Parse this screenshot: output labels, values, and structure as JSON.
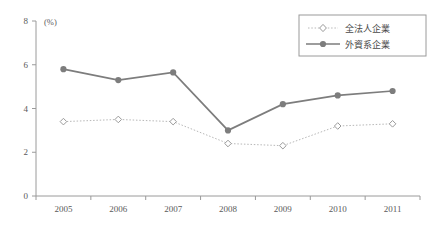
{
  "chart_data": {
    "type": "line",
    "title": "",
    "xlabel": "",
    "ylabel": "",
    "unit_label": "(%)",
    "categories": [
      "2005",
      "2006",
      "2007",
      "2008",
      "2009",
      "2010",
      "2011"
    ],
    "ylim": [
      0,
      8
    ],
    "yticks": [
      0,
      2,
      4,
      6,
      8
    ],
    "ytick_labels": [
      "0",
      "2",
      "4",
      "6",
      "8"
    ],
    "grid": false,
    "legend_position": "top-right",
    "series": [
      {
        "name": "全法人企業",
        "values": [
          3.4,
          3.5,
          3.4,
          2.4,
          2.3,
          3.2,
          3.3
        ],
        "color": "#b8b8b8",
        "marker": "open-diamond",
        "line_style": "dotted"
      },
      {
        "name": "外資系企業",
        "values": [
          5.8,
          5.3,
          5.65,
          3.0,
          4.2,
          4.6,
          4.8
        ],
        "color": "#7d7d7d",
        "marker": "filled-circle",
        "line_style": "solid"
      }
    ]
  },
  "legend": {
    "items": [
      {
        "label": "全法人企業"
      },
      {
        "label": "外資系企業"
      }
    ]
  },
  "axis": {
    "y_unit": "(%)",
    "y_labels": [
      "8",
      "6",
      "4",
      "2",
      "0"
    ],
    "x_labels": [
      "2005",
      "2006",
      "2007",
      "2008",
      "2009",
      "2010",
      "2011"
    ]
  },
  "colors": {
    "axis": "#9a9a9a",
    "series_all_corporations": "#b8b8b8",
    "series_foreign_affiliated": "#7d7d7d",
    "legend_border": "#9a9a9a",
    "text": "#4a4a4a",
    "background": "#ffffff"
  }
}
